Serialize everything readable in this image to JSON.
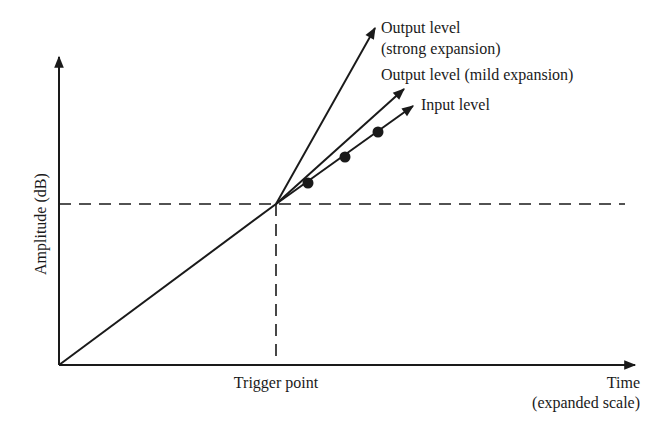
{
  "diagram": {
    "colors": {
      "ink": "#1a1a1a",
      "background": "#ffffff"
    },
    "axes": {
      "y_label": "Amplitude (dB)",
      "x_label_line1": "Time",
      "x_label_line2": "(expanded scale)",
      "origin": [
        59,
        365
      ],
      "y_top": [
        59,
        55
      ],
      "x_end": [
        637,
        365
      ]
    },
    "trigger": {
      "label": "Trigger point",
      "point": [
        276,
        204
      ]
    },
    "lines": [
      {
        "id": "strong",
        "label_line1": "Output level",
        "label_line2": "(strong expansion)",
        "end": [
          376,
          26
        ]
      },
      {
        "id": "mild",
        "label_line1": "Output level (mild expansion)",
        "end": [
          406,
          87
        ]
      },
      {
        "id": "input",
        "label_line1": "Input level",
        "end": [
          415,
          105
        ]
      }
    ],
    "input_markers": [
      [
        308,
        183
      ],
      [
        345,
        157
      ],
      [
        378,
        132
      ]
    ]
  }
}
